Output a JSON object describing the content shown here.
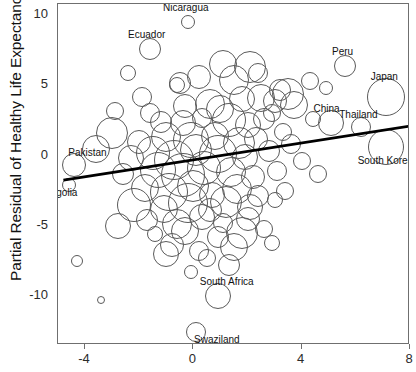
{
  "chart_data": {
    "type": "scatter",
    "title": "",
    "xlabel": "",
    "ylabel": "Partial Residual of Healthy Life Expectancy (year)",
    "xlim": [
      -5.0,
      8.0
    ],
    "ylim": [
      -13.5,
      10.8
    ],
    "xticks": [
      -4,
      0,
      4,
      8
    ],
    "xtick_labels": [
      "-4",
      "0",
      "4",
      "8"
    ],
    "yticks": [
      10,
      5,
      0,
      -5,
      -10
    ],
    "ytick_labels": [
      "10",
      "5",
      "0",
      "-5",
      "-10"
    ],
    "grid": false,
    "legend": null,
    "marker": "open-circle-bubble",
    "note": "bubble area encodes an unlabeled third variable (population)",
    "trend_line": {
      "type": "linear-fit",
      "x_start": -4.8,
      "y_start": -1.75,
      "x_end": 8.0,
      "y_end": 2.1,
      "color": "#000000",
      "width": 2.6
    },
    "annotations": [
      {
        "label": "Nicaragua",
        "x": -0.2,
        "y": 9.5,
        "size": 7
      },
      {
        "label": "Ecuador",
        "x": -1.6,
        "y": 7.6,
        "size": 11
      },
      {
        "label": "Peru",
        "x": 5.6,
        "y": 6.4,
        "size": 11
      },
      {
        "label": "Japan",
        "x": 7.1,
        "y": 4.2,
        "size": 19
      },
      {
        "label": "China",
        "x": 5.1,
        "y": 2.3,
        "size": 13
      },
      {
        "label": "Thailand",
        "x": 6.2,
        "y": 2.0,
        "size": 10
      },
      {
        "label": "South Korea",
        "x": 7.1,
        "y": 0.6,
        "size": 18
      },
      {
        "label": "Pakistan",
        "x": -4.4,
        "y": -0.7,
        "size": 12
      },
      {
        "label": "Mongolia",
        "x": -4.6,
        "y": -2.1,
        "size": 7
      },
      {
        "label": "South Africa",
        "x": 0.9,
        "y": -10.0,
        "size": 13
      },
      {
        "label": "Swaziland",
        "x": 0.1,
        "y": -12.6,
        "size": 10
      }
    ],
    "points": [
      {
        "x": -0.2,
        "y": 9.5,
        "s": 7
      },
      {
        "x": -1.6,
        "y": 7.6,
        "s": 11
      },
      {
        "x": 5.6,
        "y": 6.4,
        "s": 11
      },
      {
        "x": 7.1,
        "y": 4.2,
        "s": 19
      },
      {
        "x": 5.1,
        "y": 2.3,
        "s": 13
      },
      {
        "x": 6.2,
        "y": 2.0,
        "s": 10
      },
      {
        "x": 7.1,
        "y": 0.6,
        "s": 18
      },
      {
        "x": -4.4,
        "y": -0.7,
        "s": 12
      },
      {
        "x": -4.6,
        "y": -2.1,
        "s": 7
      },
      {
        "x": 0.9,
        "y": -10.0,
        "s": 13
      },
      {
        "x": 0.1,
        "y": -12.6,
        "s": 10
      },
      {
        "x": 1.1,
        "y": 6.5,
        "s": 14
      },
      {
        "x": 2.1,
        "y": 6.3,
        "s": 16
      },
      {
        "x": 0.2,
        "y": 5.6,
        "s": 12
      },
      {
        "x": 1.5,
        "y": 5.4,
        "s": 15
      },
      {
        "x": -0.6,
        "y": 5.0,
        "s": 8
      },
      {
        "x": -0.5,
        "y": 5.2,
        "s": 11
      },
      {
        "x": 3.2,
        "y": 4.7,
        "s": 11
      },
      {
        "x": -1.9,
        "y": 4.2,
        "s": 10
      },
      {
        "x": 1.8,
        "y": 4.0,
        "s": 13
      },
      {
        "x": 2.5,
        "y": 4.1,
        "s": 14
      },
      {
        "x": 3.0,
        "y": 3.9,
        "s": 12
      },
      {
        "x": 3.5,
        "y": 4.4,
        "s": 16
      },
      {
        "x": 3.7,
        "y": 3.6,
        "s": 14
      },
      {
        "x": -2.9,
        "y": 3.2,
        "s": 9
      },
      {
        "x": -1.6,
        "y": 3.0,
        "s": 10
      },
      {
        "x": -0.3,
        "y": 3.5,
        "s": 12
      },
      {
        "x": 0.6,
        "y": 3.7,
        "s": 15
      },
      {
        "x": 1.0,
        "y": 3.3,
        "s": 14
      },
      {
        "x": 2.9,
        "y": 3.0,
        "s": 9
      },
      {
        "x": 4.4,
        "y": 2.6,
        "s": 8
      },
      {
        "x": -3.0,
        "y": 1.6,
        "s": 16
      },
      {
        "x": -1.2,
        "y": 2.4,
        "s": 11
      },
      {
        "x": -0.4,
        "y": 2.3,
        "s": 13
      },
      {
        "x": 0.3,
        "y": 2.7,
        "s": 10
      },
      {
        "x": 1.3,
        "y": 2.5,
        "s": 17
      },
      {
        "x": 2.0,
        "y": 2.2,
        "s": 13
      },
      {
        "x": 2.6,
        "y": 2.6,
        "s": 11
      },
      {
        "x": 3.3,
        "y": 1.7,
        "s": 9
      },
      {
        "x": -3.6,
        "y": 0.5,
        "s": 14
      },
      {
        "x": -2.0,
        "y": 1.0,
        "s": 12
      },
      {
        "x": -1.0,
        "y": 1.3,
        "s": 15
      },
      {
        "x": -0.1,
        "y": 1.1,
        "s": 18
      },
      {
        "x": 0.8,
        "y": 1.4,
        "s": 14
      },
      {
        "x": 1.7,
        "y": 0.9,
        "s": 16
      },
      {
        "x": 2.3,
        "y": 1.2,
        "s": 12
      },
      {
        "x": 3.6,
        "y": 0.8,
        "s": 10
      },
      {
        "x": -2.3,
        "y": -0.2,
        "s": 13
      },
      {
        "x": -1.5,
        "y": 0.2,
        "s": 17
      },
      {
        "x": -0.7,
        "y": -0.3,
        "s": 20
      },
      {
        "x": 0.1,
        "y": 0.4,
        "s": 16
      },
      {
        "x": 0.9,
        "y": 0.1,
        "s": 19
      },
      {
        "x": 1.9,
        "y": -0.1,
        "s": 13
      },
      {
        "x": 2.8,
        "y": 0.3,
        "s": 11
      },
      {
        "x": 4.0,
        "y": -0.4,
        "s": 9
      },
      {
        "x": -2.6,
        "y": -1.3,
        "s": 11
      },
      {
        "x": -1.3,
        "y": -1.0,
        "s": 18
      },
      {
        "x": -0.4,
        "y": -1.4,
        "s": 22
      },
      {
        "x": 0.4,
        "y": -0.9,
        "s": 17
      },
      {
        "x": 1.4,
        "y": -1.2,
        "s": 15
      },
      {
        "x": 2.2,
        "y": -1.5,
        "s": 12
      },
      {
        "x": 3.1,
        "y": -1.1,
        "s": 10
      },
      {
        "x": 4.6,
        "y": -1.3,
        "s": 9
      },
      {
        "x": -1.8,
        "y": -2.3,
        "s": 14
      },
      {
        "x": -0.9,
        "y": -2.6,
        "s": 19
      },
      {
        "x": 0.0,
        "y": -2.2,
        "s": 16
      },
      {
        "x": 0.7,
        "y": -2.8,
        "s": 13
      },
      {
        "x": 1.6,
        "y": -2.4,
        "s": 15
      },
      {
        "x": 2.4,
        "y": -2.9,
        "s": 11
      },
      {
        "x": 3.4,
        "y": -2.5,
        "s": 9
      },
      {
        "x": -2.2,
        "y": -3.5,
        "s": 17
      },
      {
        "x": -1.1,
        "y": -3.8,
        "s": 14
      },
      {
        "x": -0.2,
        "y": -3.4,
        "s": 20
      },
      {
        "x": 0.6,
        "y": -3.9,
        "s": 12
      },
      {
        "x": 1.2,
        "y": -3.3,
        "s": 16
      },
      {
        "x": 2.1,
        "y": -3.7,
        "s": 13
      },
      {
        "x": 3.0,
        "y": -3.2,
        "s": 8
      },
      {
        "x": -1.7,
        "y": -4.6,
        "s": 11
      },
      {
        "x": -0.6,
        "y": -4.9,
        "s": 15
      },
      {
        "x": 0.3,
        "y": -4.4,
        "s": 13
      },
      {
        "x": 1.1,
        "y": -4.8,
        "s": 10
      },
      {
        "x": 2.0,
        "y": -4.5,
        "s": 12
      },
      {
        "x": -2.8,
        "y": -5.0,
        "s": 13
      },
      {
        "x": -1.4,
        "y": -5.6,
        "s": 8
      },
      {
        "x": -0.3,
        "y": -5.4,
        "s": 14
      },
      {
        "x": 0.9,
        "y": -5.8,
        "s": 11
      },
      {
        "x": 1.8,
        "y": -5.5,
        "s": 16
      },
      {
        "x": 2.6,
        "y": -5.2,
        "s": 9
      },
      {
        "x": -0.8,
        "y": -6.4,
        "s": 12
      },
      {
        "x": 0.2,
        "y": -6.8,
        "s": 10
      },
      {
        "x": 1.5,
        "y": -6.5,
        "s": 14
      },
      {
        "x": 2.9,
        "y": -6.2,
        "s": 8
      },
      {
        "x": -4.3,
        "y": -7.5,
        "s": 6
      },
      {
        "x": 0.5,
        "y": -7.3,
        "s": 9
      },
      {
        "x": 1.3,
        "y": -7.8,
        "s": 11
      },
      {
        "x": -0.1,
        "y": -8.3,
        "s": 7
      },
      {
        "x": -3.4,
        "y": -10.3,
        "s": 4
      },
      {
        "x": -1.0,
        "y": -7.0,
        "s": 13
      },
      {
        "x": 4.3,
        "y": 5.3,
        "s": 9
      },
      {
        "x": 4.9,
        "y": 4.8,
        "s": 7
      },
      {
        "x": 2.4,
        "y": 5.9,
        "s": 10
      },
      {
        "x": -2.4,
        "y": 5.9,
        "s": 8
      }
    ]
  },
  "axes": {
    "ylabel": "Partial Residual of Healthy Life Expectancy (year)"
  }
}
